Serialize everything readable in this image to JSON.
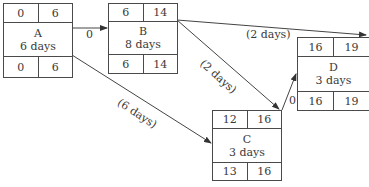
{
  "diagram": {
    "type": "activity-on-node network",
    "nodes": [
      {
        "id": "A",
        "name": "A",
        "duration": "6 days",
        "es": "0",
        "ef": "6",
        "ls": "0",
        "lf": "6"
      },
      {
        "id": "B",
        "name": "B",
        "duration": "8 days",
        "es": "6",
        "ef": "14",
        "ls": "6",
        "lf": "14"
      },
      {
        "id": "C",
        "name": "C",
        "duration": "3 days",
        "es": "12",
        "ef": "16",
        "ls": "13",
        "lf": "16"
      },
      {
        "id": "D",
        "name": "D",
        "duration": "3 days",
        "es": "16",
        "ef": "19",
        "ls": "16",
        "lf": "19"
      }
    ],
    "edges": [
      {
        "from": "A",
        "to": "B",
        "label": "0"
      },
      {
        "from": "A",
        "to": "C",
        "label": "(6 days)"
      },
      {
        "from": "B",
        "to": "C",
        "label": "(2 days)"
      },
      {
        "from": "B",
        "to": "D",
        "label": "(2 days)"
      },
      {
        "from": "C",
        "to": "D",
        "label": "0"
      }
    ]
  }
}
